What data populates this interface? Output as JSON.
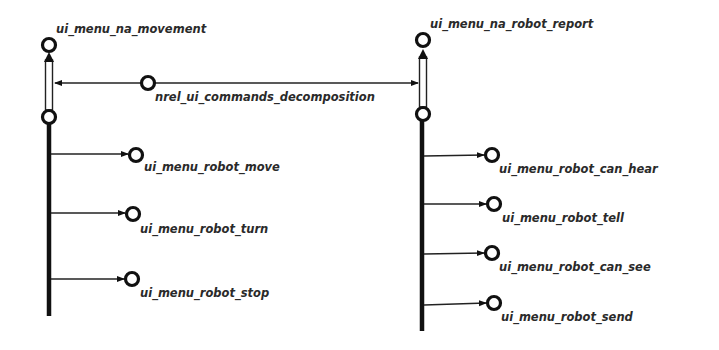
{
  "diagram": {
    "type": "semantic-network",
    "relation": {
      "label": "nrel_ui_commands_decomposition"
    },
    "left_group": {
      "parent": {
        "label": "ui_menu_na_movement"
      },
      "children": [
        {
          "label": "ui_menu_robot_move"
        },
        {
          "label": "ui_menu_robot_turn"
        },
        {
          "label": "ui_menu_robot_stop"
        }
      ]
    },
    "right_group": {
      "parent": {
        "label": "ui_menu_na_robot_report"
      },
      "children": [
        {
          "label": "ui_menu_robot_can_hear"
        },
        {
          "label": "ui_menu_robot_tell"
        },
        {
          "label": "ui_menu_robot_can_see"
        },
        {
          "label": "ui_menu_robot_send"
        }
      ]
    },
    "colors": {
      "background": "#ffffff",
      "stroke": "#111111",
      "text": "#2a2a2a"
    }
  }
}
